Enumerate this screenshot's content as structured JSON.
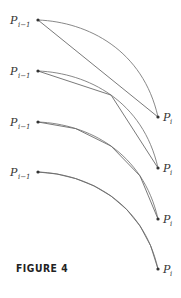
{
  "figure": {
    "caption": "FIGURE 4"
  },
  "labels": {
    "start_main": "P",
    "start_sub": "i−1",
    "end_main": "P",
    "end_sub": "i"
  },
  "panels": [
    {
      "name": "panel-1",
      "origin_y": 20,
      "chords": 1
    },
    {
      "name": "panel-2",
      "origin_y": 71,
      "chords": 2
    },
    {
      "name": "panel-3",
      "origin_y": 122,
      "chords": 4
    },
    {
      "name": "panel-4",
      "origin_y": 172,
      "chords": 8
    }
  ],
  "colors": {
    "curve": "#7a7a7a",
    "chord": "#6a6a6a",
    "point": "#333333",
    "text": "#333333"
  }
}
